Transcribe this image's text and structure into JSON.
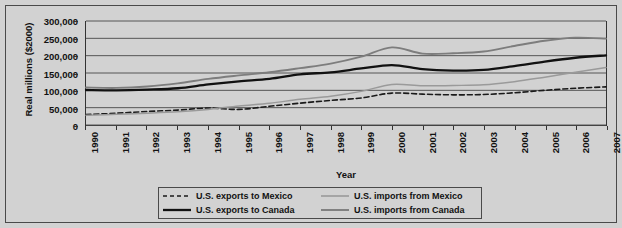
{
  "chart_data": {
    "type": "line",
    "title": "",
    "xlabel": "Year",
    "ylabel": "Real millions ($2000)",
    "x": [
      1990,
      1991,
      1992,
      1993,
      1994,
      1995,
      1996,
      1997,
      1998,
      1999,
      2000,
      2001,
      2002,
      2003,
      2004,
      2005,
      2006,
      2007
    ],
    "categories": [
      "1990",
      "1991",
      "1992",
      "1993",
      "1994",
      "1995",
      "1996",
      "1997",
      "1998",
      "1999",
      "2000",
      "2001",
      "2002",
      "2003",
      "2004",
      "2005",
      "2006",
      "2007"
    ],
    "xlim": [
      1990,
      2007
    ],
    "ylim": [
      0,
      300000
    ],
    "yticks": [
      0,
      50000,
      100000,
      150000,
      200000,
      250000,
      300000
    ],
    "ytick_labels": [
      "0",
      "50,000",
      "100,000",
      "150,000",
      "200,000",
      "250,000",
      "300,000"
    ],
    "grid": true,
    "legend_position": "bottom",
    "series": [
      {
        "name": "U.S. exports to Mexico",
        "style": "dashed",
        "color": "#1a1a1a",
        "width": 1.6,
        "values": [
          30000,
          34000,
          39000,
          43000,
          49000,
          45000,
          54000,
          63000,
          71000,
          78000,
          92000,
          89000,
          87000,
          88000,
          93000,
          100000,
          106000,
          110000
        ]
      },
      {
        "name": "U.S. imports from Mexico",
        "style": "solid",
        "color": "#9a9a9a",
        "width": 1.5,
        "values": [
          28000,
          31000,
          34000,
          38000,
          45000,
          55000,
          63000,
          74000,
          83000,
          97000,
          117000,
          113000,
          114000,
          116000,
          125000,
          138000,
          152000,
          166000
        ]
      },
      {
        "name": "U.S. exports to Canada",
        "style": "solid",
        "color": "#111111",
        "width": 2.3,
        "values": [
          101000,
          100000,
          102000,
          106000,
          117000,
          126000,
          133000,
          146000,
          152000,
          163000,
          173000,
          161000,
          157000,
          159000,
          170000,
          183000,
          194000,
          201000
        ]
      },
      {
        "name": "U.S. imports from Canada",
        "style": "solid",
        "color": "#7d7d7d",
        "width": 1.9,
        "values": [
          108000,
          107000,
          111000,
          120000,
          133000,
          143000,
          152000,
          164000,
          177000,
          197000,
          224000,
          206000,
          207000,
          212000,
          228000,
          243000,
          252000,
          249000
        ]
      }
    ]
  },
  "axes": {
    "y_title": "Real millions ($2000)",
    "x_title": "Year"
  },
  "legend": {
    "entries": [
      {
        "label": "U.S. exports to Mexico",
        "icon": "dashed-black-line-icon"
      },
      {
        "label": "U.S. imports from Mexico",
        "icon": "solid-lightgray-line-icon"
      },
      {
        "label": "U.S. exports to Canada",
        "icon": "solid-black-line-icon"
      },
      {
        "label": "U.S. imports from Canada",
        "icon": "solid-gray-line-icon"
      }
    ]
  }
}
